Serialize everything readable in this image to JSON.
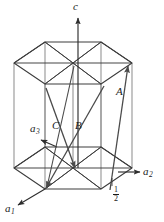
{
  "figure": {
    "kind": "hcp-unit-cell-diagram",
    "background_color": "#ffffff",
    "line_color": "#3c3c3c",
    "vector_color": "#4a4a4a",
    "vertical_edge_color": "#8c8c8c",
    "text_color": "#1a1a1a"
  },
  "labels": {
    "axis_c": "c",
    "axis_a1": "a",
    "axis_a1_sub": "1",
    "axis_a2": "a",
    "axis_a2_sub": "2",
    "axis_a3": "a",
    "axis_a3_sub": "3",
    "vector_A": "A",
    "vector_B": "B",
    "vector_C": "C",
    "fraction_numerator": "1",
    "fraction_denominator": "2"
  }
}
